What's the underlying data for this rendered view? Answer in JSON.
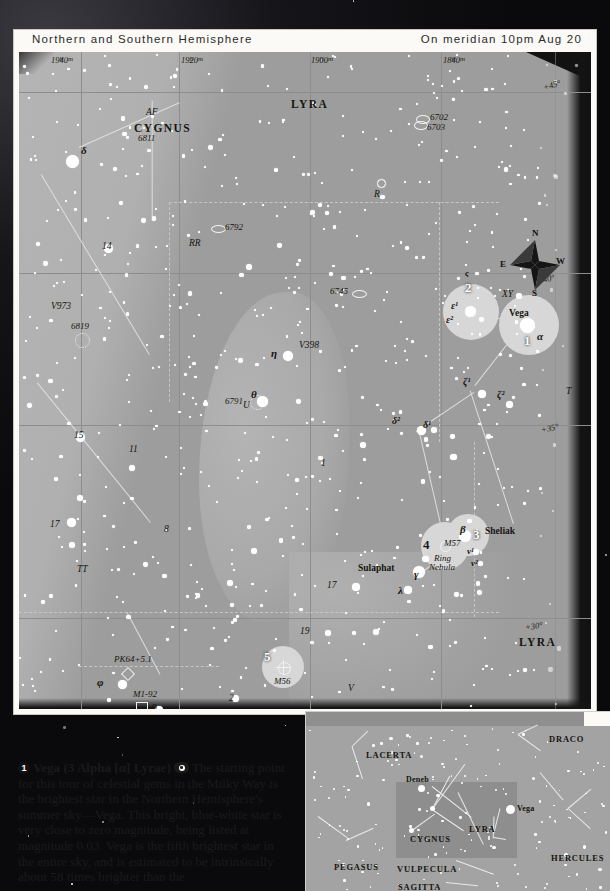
{
  "chart": {
    "header": {
      "left_title": "Northern and Southern Hemisphere",
      "right_title": "On meridian 10pm Aug 20"
    },
    "ra_ticks": [
      "19h40m",
      "19h20m",
      "19h00m",
      "18h40m"
    ],
    "dec_ticks": [
      "+45°",
      "+40°",
      "+35°",
      "+30°"
    ],
    "constellations": [
      {
        "name": "LYRA",
        "x": 282,
        "y": 52
      },
      {
        "name": "CYGNUS",
        "x": 128,
        "y": 75
      },
      {
        "name": "LYRA",
        "x": 516,
        "y": 593
      }
    ],
    "compass": {
      "n": "N",
      "s": "S",
      "e": "E",
      "w": "W"
    },
    "tour_markers": [
      {
        "num": "1",
        "label": "Vega",
        "greek": "α"
      },
      {
        "num": "2",
        "label": "",
        "greek": "ε¹ ε²"
      },
      {
        "num": "3",
        "label": "Sheliak",
        "greek": "β"
      },
      {
        "num": "4",
        "label": "M57 Ring Nebula",
        "greek": ""
      },
      {
        "num": "5",
        "label": "M56",
        "greek": ""
      },
      {
        "num": "6",
        "label": "Albireo",
        "greek": "β"
      }
    ],
    "star_names": [
      {
        "text": "Vega",
        "x": 492,
        "y": 264
      },
      {
        "text": "Sheliak",
        "x": 458,
        "y": 482
      },
      {
        "text": "Sulaphat",
        "x": 351,
        "y": 520
      },
      {
        "text": "Albireo",
        "x": 165,
        "y": 692
      }
    ],
    "dso_labels": [
      {
        "text": "6702",
        "x": 412,
        "y": 67
      },
      {
        "text": "6703",
        "x": 412,
        "y": 76
      },
      {
        "text": "6811",
        "x": 134,
        "y": 82
      },
      {
        "text": "6792",
        "x": 207,
        "y": 177
      },
      {
        "text": "6745",
        "x": 317,
        "y": 242
      },
      {
        "text": "6819",
        "x": 68,
        "y": 275
      },
      {
        "text": "6791",
        "x": 221,
        "y": 351
      },
      {
        "text": "M57",
        "x": 431,
        "y": 494
      },
      {
        "text": "Ring",
        "x": 459,
        "y": 507
      },
      {
        "text": "Nebula",
        "x": 456,
        "y": 515
      },
      {
        "text": "M56",
        "x": 264,
        "y": 633
      },
      {
        "text": "PK64+5.1",
        "x": 108,
        "y": 608
      },
      {
        "text": "M1-92",
        "x": 128,
        "y": 643
      }
    ],
    "variable_labels": [
      {
        "text": "AF",
        "x": 140,
        "y": 88
      },
      {
        "text": "R",
        "x": 361,
        "y": 142
      },
      {
        "text": "RR",
        "x": 184,
        "y": 195
      },
      {
        "text": "V973",
        "x": 50,
        "y": 257
      },
      {
        "text": "V398",
        "x": 296,
        "y": 295
      },
      {
        "text": "XY",
        "x": 497,
        "y": 245
      },
      {
        "text": "U",
        "x": 236,
        "y": 355
      },
      {
        "text": "T",
        "x": 561,
        "y": 340
      },
      {
        "text": "TT",
        "x": 72,
        "y": 520
      },
      {
        "text": "SU",
        "x": 57,
        "y": 677
      },
      {
        "text": "V",
        "x": 342,
        "y": 637
      }
    ],
    "flamsteed_labels": [
      {
        "text": "14",
        "x": 97,
        "y": 196
      },
      {
        "text": "15",
        "x": 69,
        "y": 385
      },
      {
        "text": "11",
        "x": 124,
        "y": 399
      },
      {
        "text": "1",
        "x": 316,
        "y": 413
      },
      {
        "text": "8",
        "x": 159,
        "y": 479
      },
      {
        "text": "17",
        "x": 45,
        "y": 474
      },
      {
        "text": "17",
        "x": 322,
        "y": 535
      },
      {
        "text": "19",
        "x": 295,
        "y": 581
      },
      {
        "text": "9",
        "x": 146,
        "y": 658
      },
      {
        "text": "2",
        "x": 224,
        "y": 648
      }
    ],
    "greek_labels": [
      {
        "text": "δ",
        "x": 63,
        "y": 105
      },
      {
        "text": "η",
        "x": 258,
        "y": 305
      },
      {
        "text": "θ",
        "x": 246,
        "y": 345
      },
      {
        "text": "ε¹",
        "x": 450,
        "y": 256
      },
      {
        "text": "ε²",
        "x": 446,
        "y": 270
      },
      {
        "text": "α",
        "x": 531,
        "y": 287
      },
      {
        "text": "ζ¹",
        "x": 456,
        "y": 331
      },
      {
        "text": "ζ²",
        "x": 492,
        "y": 344
      },
      {
        "text": "δ²",
        "x": 387,
        "y": 370
      },
      {
        "text": "δ¹",
        "x": 418,
        "y": 374
      },
      {
        "text": "β",
        "x": 455,
        "y": 483
      },
      {
        "text": "ν¹",
        "x": 461,
        "y": 505
      },
      {
        "text": "ν²",
        "x": 465,
        "y": 515
      },
      {
        "text": "γ",
        "x": 404,
        "y": 524
      },
      {
        "text": "λ",
        "x": 390,
        "y": 542
      },
      {
        "text": "φ",
        "x": 90,
        "y": 633
      },
      {
        "text": "β",
        "x": 157,
        "y": 705
      },
      {
        "text": "ς",
        "x": 457,
        "y": 226
      }
    ]
  },
  "caption": {
    "bullet": "1",
    "headline": "Vega (3 Alpha [α] Lyrae)",
    "icon": "eye-icon",
    "body": "The starting point for this tour of celestial gems in the Milky Way is the brightest star in the Northern Hemisphere's summer sky—Vega. This bright, blue-white star is very close to zero magnitude, being listed at magnitude 0.03. Vega is the fifth brightest star in the entire sky, and is estimated to be intrinsically about 58 times brighter than the"
  },
  "inset": {
    "labels": [
      {
        "text": "DRACO",
        "x": 245,
        "y": 27
      },
      {
        "text": "LACERTA",
        "x": 62,
        "y": 43
      },
      {
        "text": "Deneb",
        "x": 102,
        "y": 68,
        "minor": true
      },
      {
        "text": "Vega",
        "x": 214,
        "y": 96,
        "minor": true
      },
      {
        "text": "CYGNUS",
        "x": 106,
        "y": 127
      },
      {
        "text": "LYRA",
        "x": 167,
        "y": 118
      },
      {
        "text": "HERCULES",
        "x": 248,
        "y": 146
      },
      {
        "text": "PEGASUS",
        "x": 29,
        "y": 155
      },
      {
        "text": "VULPECULA",
        "x": 92,
        "y": 157
      },
      {
        "text": "SAGITTA",
        "x": 93,
        "y": 176
      }
    ]
  },
  "chart_data": {
    "type": "scatter",
    "xlabel": "Right Ascension",
    "ylabel": "Declination",
    "xlim": [
      "19h50m",
      "18h30m"
    ],
    "ylim": [
      28,
      47
    ],
    "grid": true,
    "legend": "none",
    "xticks": [
      "19h40m",
      "19h20m",
      "19h00m",
      "18h40m"
    ],
    "yticks": [
      "+45°",
      "+40°",
      "+35°",
      "+30°"
    ],
    "annotations": [
      "1 Vega (alpha Lyrae)",
      "2 epsilon1/epsilon2 Lyrae",
      "3 beta Lyrae (Sheliak)",
      "4 M57 Ring Nebula",
      "5 M56",
      "6 Albireo (beta Cygni)"
    ]
  }
}
